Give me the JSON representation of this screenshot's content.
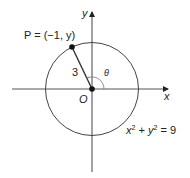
{
  "diagram": {
    "type": "unit-circle-style trig diagram",
    "axes": {
      "x_label": "x",
      "y_label": "y",
      "origin_label": "O"
    },
    "circle": {
      "equation_lhs": "x",
      "equation_plus": " + ",
      "equation_y": "y",
      "equation_rhs": " = 9",
      "exponent": "2",
      "radius": 3
    },
    "point": {
      "label": "P = (−1, y)",
      "x": -1
    },
    "segment_label": "3",
    "angle_label": "θ",
    "colors": {
      "stroke": "#333333",
      "point": "#111111"
    }
  }
}
